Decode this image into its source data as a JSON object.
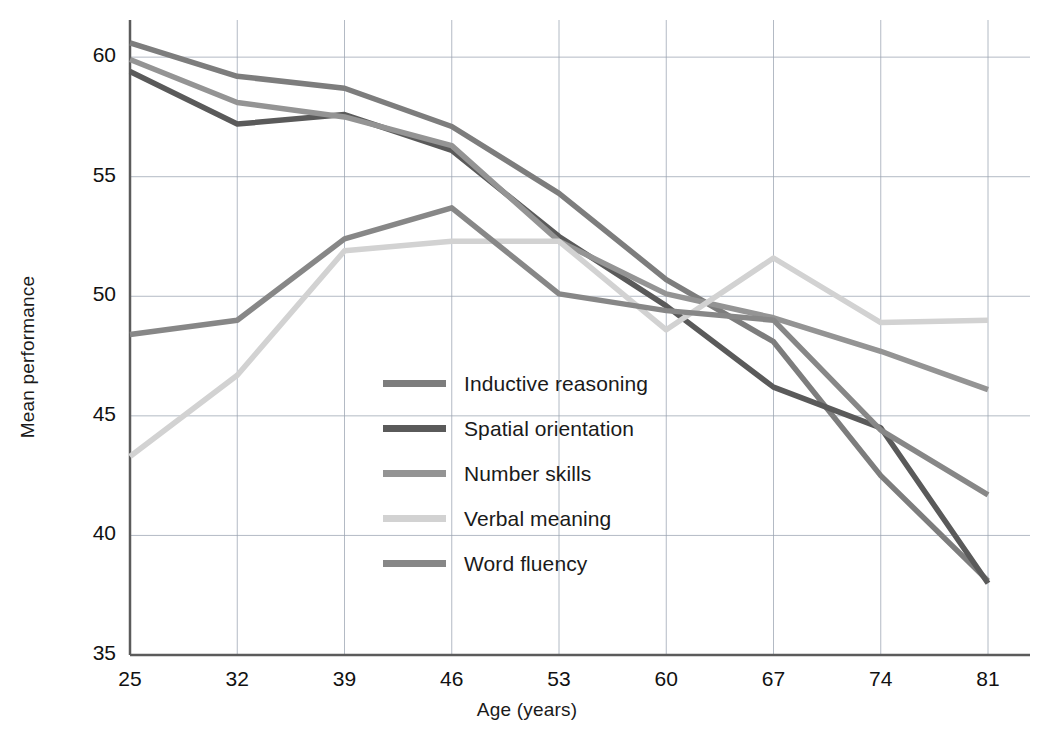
{
  "chart_data": {
    "type": "line",
    "title": "",
    "xlabel": "Age (years)",
    "ylabel": "Mean performance",
    "x": [
      25,
      32,
      39,
      46,
      53,
      60,
      67,
      74,
      81
    ],
    "categories": [
      "25",
      "32",
      "39",
      "46",
      "53",
      "60",
      "67",
      "74",
      "81"
    ],
    "xlim": [
      25,
      81
    ],
    "ylim": [
      35,
      60.8
    ],
    "yticks": [
      35,
      40,
      45,
      50,
      55,
      60
    ],
    "ytick_labels": [
      "35",
      "40",
      "45",
      "50",
      "55",
      "60"
    ],
    "grid": true,
    "legend_position": "center-left-inside",
    "series": [
      {
        "name": "Inductive reasoning",
        "color": "#7d7d7d",
        "values": [
          60.6,
          59.2,
          58.7,
          57.1,
          54.3,
          50.7,
          48.1,
          42.5,
          38.1
        ]
      },
      {
        "name": "Spatial orientation",
        "color": "#5a5a5a",
        "values": [
          59.4,
          57.2,
          57.6,
          56.1,
          52.5,
          49.6,
          46.2,
          44.5,
          38.0
        ]
      },
      {
        "name": "Number skills",
        "color": "#949494",
        "values": [
          59.9,
          58.1,
          57.5,
          56.3,
          52.3,
          50.1,
          49.1,
          47.7,
          46.1
        ]
      },
      {
        "name": "Verbal meaning",
        "color": "#d2d2d2",
        "values": [
          43.3,
          46.7,
          51.9,
          52.3,
          52.3,
          48.6,
          51.6,
          48.9,
          49.0
        ]
      },
      {
        "name": "Word fluency",
        "color": "#878787",
        "values": [
          48.4,
          49.0,
          52.4,
          53.7,
          50.1,
          49.4,
          49.0,
          44.4,
          41.7
        ]
      }
    ]
  },
  "axes": {
    "x_title": "Age (years)",
    "y_title": "Mean performance"
  },
  "legend": {
    "items": [
      {
        "label": "Inductive reasoning",
        "color": "#7d7d7d"
      },
      {
        "label": "Spatial orientation",
        "color": "#5a5a5a"
      },
      {
        "label": "Number skills",
        "color": "#949494"
      },
      {
        "label": "Verbal meaning",
        "color": "#d2d2d2"
      },
      {
        "label": "Word fluency",
        "color": "#878787"
      }
    ]
  },
  "colors": {
    "axis": "#5b5b5b",
    "grid": "#9aa3b0",
    "text": "#1a1a1a",
    "background": "#ffffff"
  }
}
